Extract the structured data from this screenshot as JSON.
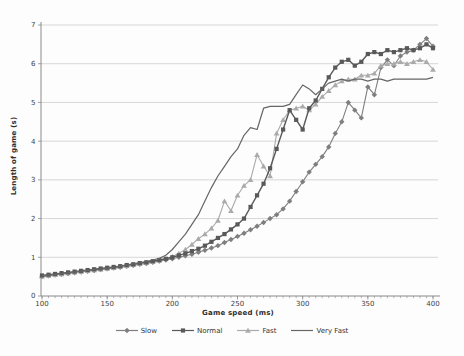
{
  "figure": {
    "background": "#fdfdfd"
  },
  "chart_data": {
    "type": "line",
    "title": "",
    "xlabel": "Game speed (ms)",
    "ylabel": "Length of game (s)",
    "xlim": [
      100,
      400
    ],
    "ylim": [
      0,
      7
    ],
    "xticks": [
      100,
      150,
      200,
      250,
      300,
      350,
      400
    ],
    "yticks": [
      0,
      1,
      2,
      3,
      4,
      5,
      6,
      7
    ],
    "x_minor_tick_step": 5,
    "grid": "horizontal-only",
    "legend_position": "bottom-center",
    "axis_color": "#8a8a8a",
    "gridline_color": "#c9c9c9",
    "tick_label_color": "#3f3f3f",
    "x": [
      100,
      105,
      110,
      115,
      120,
      125,
      130,
      135,
      140,
      145,
      150,
      155,
      160,
      165,
      170,
      175,
      180,
      185,
      190,
      195,
      200,
      205,
      210,
      215,
      220,
      225,
      230,
      235,
      240,
      245,
      250,
      255,
      260,
      265,
      270,
      275,
      280,
      285,
      290,
      295,
      300,
      305,
      310,
      315,
      320,
      325,
      330,
      335,
      340,
      345,
      350,
      355,
      360,
      365,
      370,
      375,
      380,
      385,
      390,
      395,
      400
    ],
    "series": [
      {
        "name": "Slow",
        "marker": "diamond",
        "color": "#7f7f7f",
        "line_width": 1.1,
        "values": [
          0.5,
          0.52,
          0.54,
          0.56,
          0.58,
          0.6,
          0.62,
          0.64,
          0.66,
          0.68,
          0.7,
          0.72,
          0.74,
          0.77,
          0.79,
          0.82,
          0.84,
          0.87,
          0.9,
          0.93,
          0.96,
          1.0,
          1.04,
          1.08,
          1.13,
          1.18,
          1.24,
          1.3,
          1.38,
          1.46,
          1.54,
          1.62,
          1.71,
          1.8,
          1.9,
          2.0,
          2.1,
          2.25,
          2.45,
          2.7,
          2.95,
          3.2,
          3.4,
          3.6,
          3.85,
          4.2,
          4.5,
          5.0,
          4.8,
          4.6,
          5.4,
          5.2,
          5.9,
          6.1,
          5.95,
          6.2,
          6.3,
          6.35,
          6.5,
          6.65,
          6.45
        ]
      },
      {
        "name": "Normal",
        "marker": "square",
        "color": "#595959",
        "line_width": 1.4,
        "values": [
          0.53,
          0.55,
          0.57,
          0.59,
          0.61,
          0.63,
          0.65,
          0.67,
          0.69,
          0.71,
          0.73,
          0.75,
          0.77,
          0.8,
          0.82,
          0.85,
          0.87,
          0.9,
          0.93,
          0.96,
          1.0,
          1.05,
          1.1,
          1.16,
          1.22,
          1.3,
          1.4,
          1.5,
          1.6,
          1.72,
          1.85,
          2.0,
          2.3,
          2.6,
          2.9,
          3.3,
          3.8,
          4.3,
          4.8,
          4.55,
          4.3,
          4.85,
          5.05,
          5.35,
          5.65,
          5.9,
          6.05,
          6.1,
          5.95,
          6.05,
          6.25,
          6.3,
          6.25,
          6.35,
          6.3,
          6.35,
          6.4,
          6.35,
          6.4,
          6.5,
          6.4
        ]
      },
      {
        "name": "Fast",
        "marker": "triangle",
        "color": "#aaaaaa",
        "line_width": 1.1,
        "values": [
          0.51,
          0.53,
          0.55,
          0.57,
          0.59,
          0.61,
          0.63,
          0.65,
          0.67,
          0.69,
          0.71,
          0.73,
          0.76,
          0.78,
          0.81,
          0.83,
          0.86,
          0.89,
          0.92,
          0.96,
          1.02,
          1.1,
          1.2,
          1.33,
          1.48,
          1.6,
          1.75,
          1.95,
          2.45,
          2.2,
          2.6,
          2.85,
          3.0,
          3.65,
          3.35,
          3.1,
          4.2,
          4.55,
          4.8,
          4.85,
          4.9,
          4.8,
          4.95,
          5.15,
          5.3,
          5.45,
          5.55,
          5.6,
          5.6,
          5.7,
          5.7,
          5.75,
          5.95,
          6.0,
          6.0,
          6.05,
          6.0,
          6.05,
          6.1,
          6.05,
          5.85
        ]
      },
      {
        "name": "Very Fast",
        "marker": "none",
        "color": "#666666",
        "line_width": 1.2,
        "values": [
          0.52,
          0.54,
          0.56,
          0.58,
          0.6,
          0.62,
          0.64,
          0.66,
          0.68,
          0.7,
          0.72,
          0.74,
          0.77,
          0.8,
          0.83,
          0.86,
          0.89,
          0.93,
          0.97,
          1.05,
          1.2,
          1.4,
          1.6,
          1.85,
          2.1,
          2.45,
          2.8,
          3.1,
          3.35,
          3.6,
          3.8,
          4.15,
          4.35,
          4.3,
          4.85,
          4.9,
          4.9,
          4.9,
          4.95,
          5.2,
          5.45,
          5.35,
          5.2,
          5.35,
          5.5,
          5.55,
          5.6,
          5.55,
          5.6,
          5.6,
          5.55,
          5.6,
          5.6,
          5.55,
          5.6,
          5.6,
          5.6,
          5.6,
          5.6,
          5.6,
          5.65
        ]
      }
    ]
  }
}
